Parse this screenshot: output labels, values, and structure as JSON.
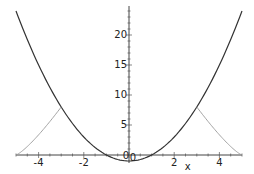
{
  "chart_data": {
    "type": "line",
    "title": "",
    "xlabel": "x",
    "ylabel": "",
    "xlim": [
      -5,
      5
    ],
    "ylim": [
      -1,
      24
    ],
    "grid": false,
    "x_ticks": [
      -4,
      -2,
      0,
      2,
      4
    ],
    "y_ticks": [
      5,
      10,
      15,
      20
    ],
    "x_tick_labels": [
      "-4",
      "-2",
      "0",
      "2",
      "4"
    ],
    "y_tick_labels": [
      "5",
      "10",
      "15",
      "20"
    ],
    "origin_labels": [
      "0",
      "0"
    ],
    "series": [
      {
        "name": "parabola",
        "style": "dark solid",
        "color": "#333333",
        "x": [
          -5,
          -4,
          -3,
          -2,
          -1,
          0,
          1,
          2,
          3,
          4,
          5
        ],
        "y": [
          24,
          15,
          8,
          3,
          0,
          -1,
          0,
          3,
          8,
          15,
          24
        ]
      },
      {
        "name": "left-hump",
        "style": "light solid",
        "color": "#999999",
        "x": [
          -5,
          -4.5,
          -4,
          -3.5,
          -3
        ],
        "y": [
          0,
          1.8,
          3.8,
          5.8,
          8
        ]
      },
      {
        "name": "right-hump",
        "style": "light solid",
        "color": "#999999",
        "x": [
          3,
          3.5,
          4,
          4.5,
          5
        ],
        "y": [
          8,
          5.8,
          3.8,
          1.8,
          0
        ]
      }
    ]
  }
}
